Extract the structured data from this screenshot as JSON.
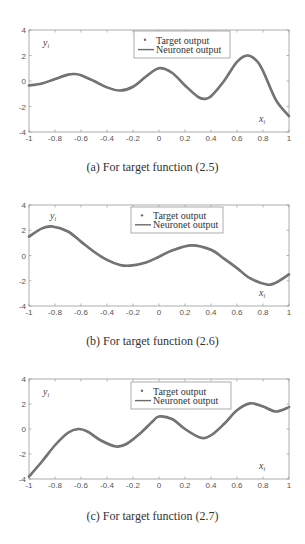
{
  "style": {
    "curve_color": "#6b6b6b",
    "axis_color": "#9a9a9a",
    "tick_label_color": "#555555",
    "legend_border": "#8a8a8a"
  },
  "chart_data": [
    {
      "type": "line",
      "panel": "a",
      "caption": "(a) For target function (2.5)",
      "ylabel": "y_i",
      "xlabel": "x_i",
      "xlim": [
        -1,
        1
      ],
      "ylim": [
        -4,
        4
      ],
      "xticks": [
        -1,
        -0.8,
        -0.6,
        -0.4,
        -0.2,
        0,
        0.2,
        0.4,
        0.6,
        0.8,
        1
      ],
      "xtick_labels": [
        "-1",
        "-0.8",
        "-0.6",
        "-0.4",
        "-0.2",
        "0",
        "0.2",
        "0.4",
        "0.6",
        "0.8",
        "1"
      ],
      "yticks": [
        -4,
        -2,
        0,
        2,
        4
      ],
      "ytick_labels": [
        "-4",
        "-2",
        "0",
        "2",
        "4"
      ],
      "legend": [
        "Target output",
        "Neuronet output"
      ],
      "legend_position": "upper center",
      "series": [
        {
          "name": "Target output",
          "marker": "dot",
          "x": [
            -1,
            -0.9,
            -0.8,
            -0.7,
            -0.65,
            -0.6,
            -0.5,
            -0.4,
            -0.3,
            -0.2,
            -0.1,
            0,
            0.1,
            0.2,
            0.3,
            0.35,
            0.4,
            0.5,
            0.6,
            0.68,
            0.75,
            0.8,
            0.9,
            1
          ],
          "values": [
            -0.35,
            -0.2,
            0.15,
            0.5,
            0.55,
            0.45,
            0.0,
            -0.5,
            -0.75,
            -0.45,
            0.35,
            1.0,
            0.65,
            -0.35,
            -1.25,
            -1.4,
            -1.2,
            0.0,
            1.5,
            2.0,
            1.6,
            0.8,
            -1.5,
            -2.75
          ]
        },
        {
          "name": "Neuronet output",
          "marker": "line",
          "x": [
            -1,
            -0.9,
            -0.8,
            -0.7,
            -0.65,
            -0.6,
            -0.5,
            -0.4,
            -0.3,
            -0.2,
            -0.1,
            0,
            0.1,
            0.2,
            0.3,
            0.35,
            0.4,
            0.5,
            0.6,
            0.68,
            0.75,
            0.8,
            0.9,
            1
          ],
          "values": [
            -0.35,
            -0.2,
            0.15,
            0.5,
            0.55,
            0.45,
            0.0,
            -0.5,
            -0.75,
            -0.45,
            0.35,
            1.0,
            0.65,
            -0.35,
            -1.25,
            -1.4,
            -1.2,
            0.0,
            1.5,
            2.0,
            1.6,
            0.8,
            -1.5,
            -2.75
          ]
        }
      ]
    },
    {
      "type": "line",
      "panel": "b",
      "caption": "(b) For target function (2.6)",
      "ylabel": "y_i",
      "xlabel": "x_i",
      "xlim": [
        -1,
        1
      ],
      "ylim": [
        -4,
        4
      ],
      "xticks": [
        -1,
        -0.8,
        -0.6,
        -0.4,
        -0.2,
        0,
        0.2,
        0.4,
        0.6,
        0.8,
        1
      ],
      "xtick_labels": [
        "-1",
        "-0.8",
        "-0.6",
        "-0.4",
        "-0.2",
        "0",
        "0.2",
        "0.4",
        "0.6",
        "0.8",
        "1"
      ],
      "yticks": [
        -4,
        -2,
        0,
        2,
        4
      ],
      "ytick_labels": [
        "-4",
        "-2",
        "0",
        "2",
        "4"
      ],
      "legend": [
        "Target output",
        "Neuronet output"
      ],
      "legend_position": "upper center",
      "series": [
        {
          "name": "Target output",
          "marker": "dot",
          "x": [
            -1,
            -0.9,
            -0.82,
            -0.7,
            -0.6,
            -0.5,
            -0.4,
            -0.3,
            -0.22,
            -0.1,
            0,
            0.1,
            0.25,
            0.4,
            0.5,
            0.6,
            0.7,
            0.83,
            0.9,
            1
          ],
          "values": [
            1.5,
            2.15,
            2.3,
            1.9,
            1.1,
            0.3,
            -0.35,
            -0.75,
            -0.8,
            -0.55,
            -0.1,
            0.4,
            0.8,
            0.45,
            -0.25,
            -1.0,
            -1.8,
            -2.3,
            -2.15,
            -1.5
          ]
        },
        {
          "name": "Neuronet output",
          "marker": "line",
          "x": [
            -1,
            -0.9,
            -0.82,
            -0.7,
            -0.6,
            -0.5,
            -0.4,
            -0.3,
            -0.22,
            -0.1,
            0,
            0.1,
            0.25,
            0.4,
            0.5,
            0.6,
            0.7,
            0.83,
            0.9,
            1
          ],
          "values": [
            1.5,
            2.15,
            2.3,
            1.9,
            1.1,
            0.3,
            -0.35,
            -0.75,
            -0.8,
            -0.55,
            -0.1,
            0.4,
            0.8,
            0.45,
            -0.25,
            -1.0,
            -1.8,
            -2.3,
            -2.15,
            -1.5
          ]
        }
      ]
    },
    {
      "type": "line",
      "panel": "c",
      "caption": "(c) For target function (2.7)",
      "ylabel": "y_i",
      "xlabel": "x_i",
      "xlim": [
        -1,
        1
      ],
      "ylim": [
        -4,
        4
      ],
      "xticks": [
        -1,
        -0.8,
        -0.6,
        -0.4,
        -0.2,
        0,
        0.2,
        0.4,
        0.6,
        0.8,
        1
      ],
      "xtick_labels": [
        "-1",
        "-0.8",
        "-0.6",
        "-0.4",
        "-0.2",
        "0",
        "0.2",
        "0.4",
        "0.6",
        "0.8",
        "1"
      ],
      "yticks": [
        -4,
        -2,
        0,
        2,
        4
      ],
      "ytick_labels": [
        "-4",
        "-2",
        "0",
        "2",
        "4"
      ],
      "legend": [
        "Target output",
        "Neuronet output"
      ],
      "legend_position": "upper center",
      "series": [
        {
          "name": "Target output",
          "marker": "dot",
          "x": [
            -1,
            -0.9,
            -0.8,
            -0.7,
            -0.62,
            -0.55,
            -0.45,
            -0.33,
            -0.25,
            -0.15,
            -0.05,
            0,
            0.1,
            0.2,
            0.32,
            0.4,
            0.5,
            0.6,
            0.7,
            0.8,
            0.9,
            1
          ],
          "values": [
            -3.8,
            -2.6,
            -1.3,
            -0.3,
            0.0,
            -0.2,
            -0.9,
            -1.4,
            -1.2,
            -0.4,
            0.6,
            1.0,
            0.8,
            0.0,
            -0.7,
            -0.5,
            0.4,
            1.5,
            2.05,
            1.8,
            1.4,
            1.75
          ]
        },
        {
          "name": "Neuronet output",
          "marker": "line",
          "x": [
            -1,
            -0.9,
            -0.8,
            -0.7,
            -0.62,
            -0.55,
            -0.45,
            -0.33,
            -0.25,
            -0.15,
            -0.05,
            0,
            0.1,
            0.2,
            0.32,
            0.4,
            0.5,
            0.6,
            0.7,
            0.8,
            0.9,
            1
          ],
          "values": [
            -3.8,
            -2.6,
            -1.3,
            -0.3,
            0.0,
            -0.2,
            -0.9,
            -1.4,
            -1.2,
            -0.4,
            0.6,
            1.0,
            0.8,
            0.0,
            -0.7,
            -0.5,
            0.4,
            1.5,
            2.05,
            1.8,
            1.4,
            1.75
          ]
        }
      ]
    }
  ],
  "layout": [
    {
      "top": 30,
      "bottom": 132,
      "caption_y": 160,
      "legend": {
        "x": 134,
        "y": 31,
        "w": 96,
        "h": 27
      }
    },
    {
      "top": 205,
      "bottom": 306,
      "caption_y": 334,
      "legend": {
        "x": 131,
        "y": 207,
        "w": 92,
        "h": 26
      }
    },
    {
      "top": 379,
      "bottom": 479,
      "caption_y": 509,
      "legend": {
        "x": 131,
        "y": 382,
        "w": 100,
        "h": 27
      }
    }
  ]
}
